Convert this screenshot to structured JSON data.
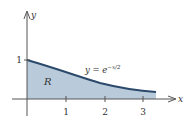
{
  "diagram": {
    "type": "region-under-curve",
    "equation": {
      "prefix": "y = e",
      "exponent": "−x/2"
    },
    "region_label": "R",
    "axes": {
      "x_label": "x",
      "y_label": "y",
      "x_ticks": [
        "1",
        "2",
        "3"
      ],
      "y_ticks": [
        "1"
      ]
    },
    "domain": [
      0,
      3.35
    ],
    "colors": {
      "fill": "#b9cbdb",
      "curve": "#2b4a6b",
      "axis": "#555555"
    }
  }
}
